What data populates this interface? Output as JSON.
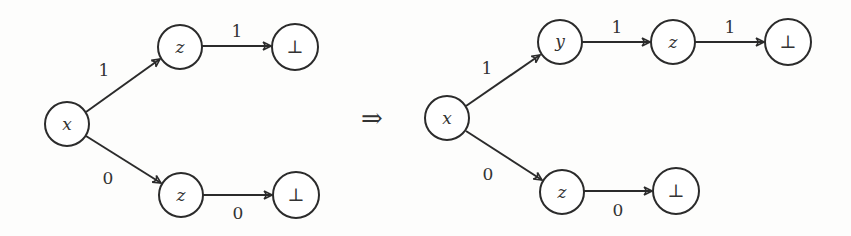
{
  "diagram": {
    "type": "decision-diagram-transformation",
    "implies_symbol": "⇒",
    "left": {
      "nodes": [
        {
          "id": "x",
          "label": "x",
          "kind": "var",
          "cx": 67,
          "cy": 124
        },
        {
          "id": "z1",
          "label": "z",
          "kind": "var",
          "cx": 180,
          "cy": 47
        },
        {
          "id": "b1",
          "label": "⊥",
          "kind": "terminal",
          "cx": 295,
          "cy": 47
        },
        {
          "id": "z0",
          "label": "z",
          "kind": "var",
          "cx": 181,
          "cy": 195
        },
        {
          "id": "b0",
          "label": "⊥",
          "kind": "terminal",
          "cx": 296,
          "cy": 195
        }
      ],
      "edges": [
        {
          "from": "x",
          "to": "z1",
          "label": "1"
        },
        {
          "from": "z1",
          "to": "b1",
          "label": "1"
        },
        {
          "from": "x",
          "to": "z0",
          "label": "0"
        },
        {
          "from": "z0",
          "to": "b0",
          "label": "0"
        }
      ]
    },
    "right": {
      "nodes": [
        {
          "id": "x",
          "label": "x",
          "kind": "var",
          "cx": 447,
          "cy": 118
        },
        {
          "id": "y",
          "label": "y",
          "kind": "var",
          "cx": 560,
          "cy": 42
        },
        {
          "id": "z1",
          "label": "z",
          "kind": "var",
          "cx": 673,
          "cy": 42
        },
        {
          "id": "b1",
          "label": "⊥",
          "kind": "terminal",
          "cx": 788,
          "cy": 42
        },
        {
          "id": "z0",
          "label": "z",
          "kind": "var",
          "cx": 562,
          "cy": 192
        },
        {
          "id": "b0",
          "label": "⊥",
          "kind": "terminal",
          "cx": 676,
          "cy": 191
        }
      ],
      "edges": [
        {
          "from": "x",
          "to": "y",
          "label": "1"
        },
        {
          "from": "y",
          "to": "z1",
          "label": "1"
        },
        {
          "from": "z1",
          "to": "b1",
          "label": "1"
        },
        {
          "from": "x",
          "to": "z0",
          "label": "0"
        },
        {
          "from": "z0",
          "to": "b0",
          "label": "0"
        }
      ]
    }
  }
}
